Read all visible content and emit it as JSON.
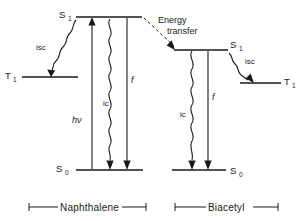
{
  "figure": {
    "background_color": "#ffffff",
    "ink_color": "#1a1a1a",
    "width": 301,
    "height": 221
  },
  "annotations": {
    "energy_transfer_line1": "Energy",
    "energy_transfer_line2": "transfer"
  },
  "left_system": {
    "species_label": "Naphthalene",
    "levels": [
      {
        "id": "S1",
        "symbol": "S",
        "subscript": "1",
        "label": "S₁"
      },
      {
        "id": "T1",
        "symbol": "T",
        "subscript": "1",
        "label": "T₁"
      },
      {
        "id": "S0",
        "symbol": "S",
        "subscript": "0",
        "label": "S₀"
      }
    ],
    "processes": [
      {
        "id": "isc",
        "label": "isc",
        "kind": "wavy-arrow",
        "direction": "down"
      },
      {
        "id": "absorption",
        "label": "hν",
        "kind": "straight-arrow",
        "direction": "up"
      },
      {
        "id": "ic",
        "label": "ic",
        "kind": "wavy-arrow",
        "direction": "down"
      },
      {
        "id": "fluorescence",
        "label": "f",
        "kind": "straight-arrow",
        "direction": "down"
      }
    ]
  },
  "right_system": {
    "species_label": "Biacetyl",
    "levels": [
      {
        "id": "S1",
        "symbol": "S",
        "subscript": "1",
        "label": "S₁"
      },
      {
        "id": "T1",
        "symbol": "T",
        "subscript": "1",
        "label": "T₁"
      },
      {
        "id": "S0",
        "symbol": "S",
        "subscript": "0",
        "label": "S₀"
      }
    ],
    "processes": [
      {
        "id": "ic",
        "label": "ic",
        "kind": "wavy-arrow",
        "direction": "down"
      },
      {
        "id": "fluorescence",
        "label": "f",
        "kind": "straight-arrow",
        "direction": "down"
      },
      {
        "id": "isc",
        "label": "isc",
        "kind": "wavy-arrow",
        "direction": "down"
      }
    ]
  }
}
